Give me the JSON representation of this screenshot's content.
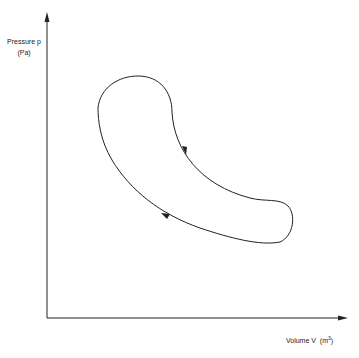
{
  "diagram": {
    "y_axis": {
      "label": "Pressure p",
      "unit": "(Pa)"
    },
    "x_axis": {
      "label": "Volume V",
      "unit_base": "(m",
      "unit_exp": "3",
      "unit_close": ")"
    },
    "cycle": {
      "direction": "counter-clockwise",
      "arrows": [
        "arrow on right/upper inner curve pointing down-right",
        "arrow on lower curve pointing up-left"
      ]
    },
    "colors": {
      "line": "#222222",
      "background": "#ffffff"
    }
  }
}
